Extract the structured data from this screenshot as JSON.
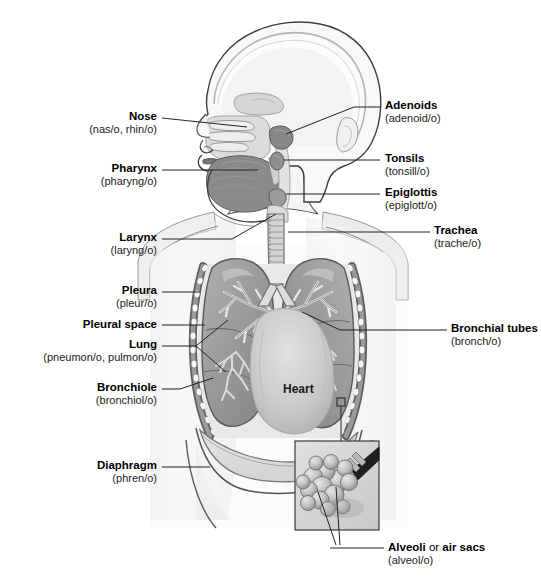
{
  "figure": {
    "type": "anatomical-illustration",
    "palette": {
      "background": "#ffffff",
      "body_fill": "#f2f2f2",
      "body_outline": "#4a4a4a",
      "skull_fill": "#f7f7f7",
      "cavity_fill": "#d8d8d8",
      "tongue_fill": "#8d8d8d",
      "lung_fill": "#9b9b9b",
      "lung_shadow": "#7e7e7e",
      "rib_fill": "#f4f4f4",
      "pleura_fill": "#6f6f6f",
      "heart_fill": "#cccccc",
      "trachea_fill": "#cfcfcf",
      "alveoli_fill": "#bdbdbd",
      "inset_fill": "#d9d9d9",
      "leader_line": "#222222",
      "text": "#000000"
    }
  },
  "inline_labels": [
    {
      "name": "heart",
      "text": "Heart",
      "x": 283,
      "y": 382
    }
  ],
  "labels_left": [
    {
      "id": "nose",
      "title": "Nose",
      "subtitle": "(nas/o, rhin/o)",
      "text_right_x": 157,
      "text_top_y": 110,
      "leader": {
        "x1": 162,
        "y1": 118,
        "x2": 247,
        "y2": 127
      }
    },
    {
      "id": "pharynx",
      "title": "Pharynx",
      "subtitle": "(pharyng/o)",
      "text_right_x": 157,
      "text_top_y": 162,
      "leader": {
        "x1": 162,
        "y1": 170,
        "x2": 258,
        "y2": 170
      }
    },
    {
      "id": "larynx",
      "title": "Larynx",
      "subtitle": "(laryng/o)",
      "text_right_x": 157,
      "text_top_y": 231,
      "leader": {
        "x1": 162,
        "y1": 239,
        "x2": 276,
        "y2": 214
      }
    },
    {
      "id": "pleura",
      "title": "Pleura",
      "subtitle": "(pleur/o)",
      "text_right_x": 157,
      "text_top_y": 284,
      "leader": {
        "x1": 162,
        "y1": 292,
        "x2": 200,
        "y2": 292
      }
    },
    {
      "id": "pleural-space",
      "title": "Pleural space",
      "subtitle": "",
      "text_right_x": 157,
      "text_top_y": 318,
      "leader": {
        "x1": 162,
        "y1": 325,
        "x2": 205,
        "y2": 325
      }
    },
    {
      "id": "lung",
      "title": "Lung",
      "subtitle": "(pneumon/o, pulmon/o)",
      "text_right_x": 157,
      "text_top_y": 338,
      "leader": {
        "x1": 162,
        "y1": 346,
        "x2": 196,
        "y2": 346
      }
    },
    {
      "id": "bronchiole",
      "title": "Bronchiole",
      "subtitle": "(bronchiol/o)",
      "text_right_x": 157,
      "text_top_y": 381,
      "leader": {
        "x1": 162,
        "y1": 389,
        "x2": 213,
        "y2": 389
      }
    },
    {
      "id": "diaphragm",
      "title": "Diaphragm",
      "subtitle": "(phren/o)",
      "text_right_x": 157,
      "text_top_y": 459,
      "leader": {
        "x1": 162,
        "y1": 467,
        "x2": 195,
        "y2": 467
      }
    }
  ],
  "labels_right": [
    {
      "id": "adenoids",
      "title": "Adenoids",
      "subtitle": "(adenoid/o)",
      "text_left_x": 385,
      "text_top_y": 99,
      "leader": {
        "x1": 380,
        "y1": 107,
        "x2": 286,
        "y2": 134
      }
    },
    {
      "id": "tonsils",
      "title": "Tonsils",
      "subtitle": "(tonsill/o)",
      "text_left_x": 385,
      "text_top_y": 152,
      "leader": {
        "x1": 380,
        "y1": 160,
        "x2": 280,
        "y2": 160
      }
    },
    {
      "id": "epiglottis",
      "title": "Epiglottis",
      "subtitle": "(epiglott/o)",
      "text_left_x": 385,
      "text_top_y": 186,
      "leader": {
        "x1": 380,
        "y1": 194,
        "x2": 278,
        "y2": 194
      }
    },
    {
      "id": "trachea",
      "title": "Trachea",
      "subtitle": "(trache/o)",
      "text_left_x": 434,
      "text_top_y": 224,
      "leader": {
        "x1": 430,
        "y1": 232,
        "x2": 288,
        "y2": 232
      }
    },
    {
      "id": "bronchial-tubes",
      "title": "Bronchial tubes",
      "subtitle": "(bronch/o)",
      "text_left_x": 451,
      "text_top_y": 322,
      "leader": {
        "x1": 447,
        "y1": 330,
        "x2": 302,
        "y2": 319
      }
    }
  ],
  "labels_bottom": [
    {
      "id": "alveoli",
      "title_bold_1": "Alveoli",
      "title_plain": " or ",
      "title_bold_2": "air sacs",
      "subtitle": "(alveol/o)",
      "text_left_x": 388,
      "text_top_y": 541,
      "leader": {
        "x1": 384,
        "y1": 548,
        "x2": 330,
        "y2": 548
      }
    }
  ],
  "annotations": {
    "inset_box": {
      "x": 295,
      "y": 441,
      "w": 84,
      "h": 89,
      "label": "alveoli-magnified-inset"
    },
    "callout_square": {
      "x": 337,
      "y": 398,
      "w": 8,
      "h": 8,
      "label": "alveoli-source-marker"
    }
  }
}
